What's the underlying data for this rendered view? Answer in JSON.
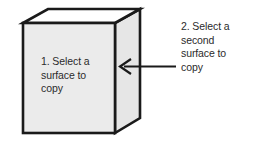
{
  "figure": {
    "type": "isometric-box-callout-diagram",
    "background_color": "#ffffff",
    "outline_color": "#1a1a1a",
    "text_color": "#2b2b2b"
  },
  "box": {
    "name": "3d-box",
    "front_face": {
      "label": "1. Select a\nsurface to\ncopy",
      "fill_color": "#ebebeb"
    },
    "top_face": {
      "fill_color": "#ffffff"
    },
    "side_face": {
      "fill_color": "#e6e6e6"
    }
  },
  "callout": {
    "name": "callout-annotation",
    "label": "2. Select a\nsecond\nsurface to\ncopy",
    "arrow": {
      "direction": "left",
      "color": "#1a1a1a"
    }
  }
}
